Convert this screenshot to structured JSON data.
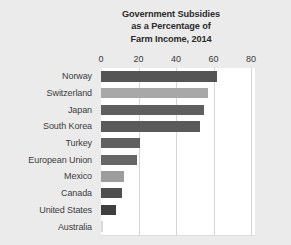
{
  "figure": {
    "background_color": "#ebebeb",
    "plot_background_color": "#ffffff",
    "gridline_color": "#d6d6d6"
  },
  "title": {
    "line1": "Government Subsidies",
    "line2": "as a Percentage of",
    "line3": "Farm Income, 2014"
  },
  "axis": {
    "ticks": [
      "0",
      "20",
      "40",
      "60",
      "80"
    ]
  },
  "chart_data": {
    "type": "bar",
    "orientation": "horizontal",
    "title": "Government Subsidies as a Percentage of Farm Income, 2014",
    "xlabel": "",
    "ylabel": "",
    "xlim": [
      0,
      80
    ],
    "xticks": [
      0,
      20,
      40,
      60,
      80
    ],
    "grid": true,
    "legend": "none",
    "categories": [
      "Norway",
      "Switzerland",
      "Japan",
      "South Korea",
      "Turkey",
      "European Union",
      "Mexico",
      "Canada",
      "United States",
      "Australia"
    ],
    "values": [
      62,
      57,
      55,
      53,
      21,
      19,
      12,
      11,
      8,
      1
    ],
    "bar_colors": [
      "#545454",
      "#a8a8a8",
      "#5f5f5f",
      "#5a5a5a",
      "#606060",
      "#676767",
      "#9d9d9d",
      "#4f4f4f",
      "#3f3f3f",
      "#d9d9d9"
    ]
  }
}
